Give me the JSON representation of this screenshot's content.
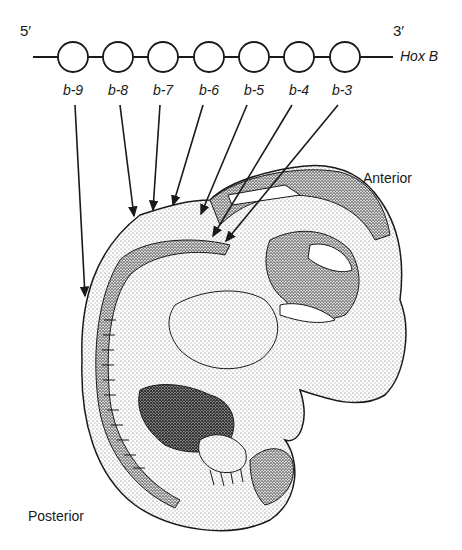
{
  "strand": {
    "five_prime": "5′",
    "three_prime": "3′",
    "cluster_label": "Hox B"
  },
  "genes": [
    {
      "label": "b-9",
      "cx": 73
    },
    {
      "label": "b-8",
      "cx": 118
    },
    {
      "label": "b-7",
      "cx": 163
    },
    {
      "label": "b-6",
      "cx": 209
    },
    {
      "label": "b-5",
      "cx": 254
    },
    {
      "label": "b-4",
      "cx": 299
    },
    {
      "label": "b-3",
      "cx": 345
    }
  ],
  "axis_labels": {
    "anterior": "Anterior",
    "posterior": "Posterior"
  },
  "colors": {
    "ink": "#1a1a1a",
    "stipple": "#444444",
    "background": "#ffffff"
  }
}
